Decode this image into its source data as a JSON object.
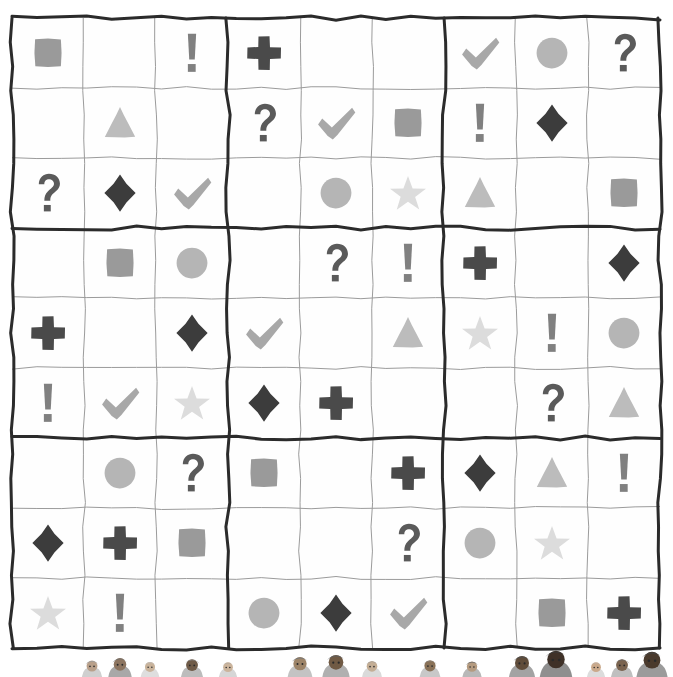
{
  "puzzle": {
    "title": "Symbol Sudoku Grid",
    "grid_size": 9,
    "box_size": 3,
    "blank_label": "empty cell",
    "symbol_legend": [
      {
        "key": "square",
        "name": "square-symbol",
        "glyph": "■",
        "color": "#9a9a9a"
      },
      {
        "key": "circle",
        "name": "circle-symbol",
        "glyph": "●",
        "color": "#b5b5b5"
      },
      {
        "key": "triangle",
        "name": "triangle-symbol",
        "glyph": "▲",
        "color": "#bcbcbc"
      },
      {
        "key": "star",
        "name": "star-symbol",
        "glyph": "★",
        "color": "#dcdcdc"
      },
      {
        "key": "diamond",
        "name": "diamond-symbol",
        "glyph": "◆",
        "color": "#3c3c3c"
      },
      {
        "key": "cross",
        "name": "cross-symbol",
        "glyph": "✚",
        "color": "#4a4a4a"
      },
      {
        "key": "check",
        "name": "check-mark-symbol",
        "glyph": "✔",
        "color": "#a8a8a8"
      },
      {
        "key": "question",
        "name": "question-mark-symbol",
        "glyph": "?",
        "color": "#5a5a5a"
      },
      {
        "key": "bang",
        "name": "exclamation-mark-symbol",
        "glyph": "!",
        "color": "#808080"
      },
      {
        "key": "",
        "name": "empty-cell",
        "glyph": "",
        "color": "#ffffff"
      }
    ],
    "rows": [
      [
        "square",
        "",
        "bang",
        "cross",
        "",
        "",
        "check",
        "circle",
        "question"
      ],
      [
        "",
        "triangle",
        "",
        "question",
        "check",
        "square",
        "bang",
        "diamond",
        ""
      ],
      [
        "question",
        "diamond",
        "check",
        "",
        "circle",
        "star",
        "triangle",
        "",
        "square"
      ],
      [
        "",
        "square",
        "circle",
        "",
        "question",
        "bang",
        "cross",
        "",
        "diamond"
      ],
      [
        "cross",
        "",
        "diamond",
        "check",
        "",
        "triangle",
        "star",
        "bang",
        "circle"
      ],
      [
        "bang",
        "check",
        "star",
        "diamond",
        "cross",
        "",
        "",
        "question",
        "triangle"
      ],
      [
        "",
        "circle",
        "question",
        "square",
        "",
        "cross",
        "diamond",
        "triangle",
        "bang"
      ],
      [
        "diamond",
        "cross",
        "square",
        "",
        "",
        "question",
        "circle",
        "star",
        ""
      ],
      [
        "star",
        "bang",
        "",
        "circle",
        "diamond",
        "check",
        "",
        "square",
        "cross"
      ]
    ]
  },
  "style": {
    "grid_border_color": "#2b2b2b",
    "grid_thin_line_color": "#9b9b9b",
    "page_background": "#ffffff",
    "box_line_width": 3,
    "thin_line_width": 1
  },
  "decoration": {
    "crowd_label": "cartoon crowd peeking over bottom edge",
    "figures": [
      {
        "name": "figure-1",
        "x": 92,
        "skin": "#b9a08a",
        "hat": "#9c9c9c",
        "body": "#cfcfcf",
        "scale": 0.78
      },
      {
        "name": "figure-2",
        "x": 120,
        "skin": "#8d7560",
        "hat": "#6f6f6f",
        "body": "#a8a8a8",
        "scale": 0.9
      },
      {
        "name": "figure-3",
        "x": 150,
        "skin": "#c9b39b",
        "hat": "#bdbdbd",
        "body": "#dedede",
        "scale": 0.72
      },
      {
        "name": "figure-4",
        "x": 192,
        "skin": "#6f5b48",
        "hat": "#8a8a8a",
        "body": "#bcbcbc",
        "scale": 0.85
      },
      {
        "name": "figure-5",
        "x": 228,
        "skin": "#cbb49c",
        "hat": "#a2a2a2",
        "body": "#d6d6d6",
        "scale": 0.7
      },
      {
        "name": "figure-6",
        "x": 300,
        "skin": "#9d8468",
        "hat": "#777777",
        "body": "#c3c3c3",
        "scale": 0.95
      },
      {
        "name": "figure-7",
        "x": 336,
        "skin": "#705a44",
        "hat": "#5e5e5e",
        "body": "#b0b0b0",
        "scale": 1.05
      },
      {
        "name": "figure-8",
        "x": 372,
        "skin": "#c4ae95",
        "hat": "#9a9a9a",
        "body": "#dadada",
        "scale": 0.76
      },
      {
        "name": "figure-9",
        "x": 430,
        "skin": "#8a7258",
        "hat": "#848484",
        "body": "#c8c8c8",
        "scale": 0.8
      },
      {
        "name": "figure-10",
        "x": 472,
        "skin": "#b59b80",
        "hat": "#6b6b6b",
        "body": "#b8b8b8",
        "scale": 0.74
      },
      {
        "name": "figure-11",
        "x": 522,
        "skin": "#5f4c3a",
        "hat": "#4f4f4f",
        "body": "#a3a3a3",
        "scale": 1.0
      },
      {
        "name": "figure-12",
        "x": 556,
        "skin": "#3f3128",
        "hat": "#3a3a3a",
        "body": "#8f8f8f",
        "scale": 1.25
      },
      {
        "name": "figure-13",
        "x": 596,
        "skin": "#caa98b",
        "hat": "#b0b0b0",
        "body": "#dcdcdc",
        "scale": 0.7
      },
      {
        "name": "figure-14",
        "x": 622,
        "skin": "#7a6450",
        "hat": "#6a6a6a",
        "body": "#bfbfbf",
        "scale": 0.85
      },
      {
        "name": "figure-15",
        "x": 652,
        "skin": "#4a3a2c",
        "hat": "#444444",
        "body": "#9b9b9b",
        "scale": 1.2
      }
    ]
  }
}
